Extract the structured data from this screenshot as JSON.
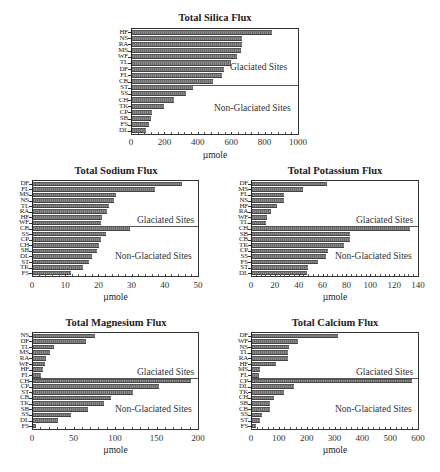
{
  "chart_data": [
    {
      "type": "bar",
      "orientation": "horizontal",
      "title": "Total Silica Flux",
      "xlabel": "µmole",
      "ylabel": "",
      "xlim": [
        0,
        1000
      ],
      "xticks": [
        0,
        200,
        400,
        600,
        800,
        1000
      ],
      "groups": [
        {
          "name": "Glaciated Sites",
          "categories": [
            "HF",
            "NS",
            "RA",
            "MS",
            "WF",
            "TL",
            "DF",
            "FL",
            "CB"
          ],
          "values": [
            845,
            660,
            660,
            655,
            630,
            595,
            555,
            540,
            490
          ]
        },
        {
          "name": "Non-Glaciated Sites",
          "categories": [
            "ST",
            "SS",
            "CH",
            "TK",
            "CP",
            "SB",
            "FS",
            "DL"
          ],
          "values": [
            365,
            325,
            255,
            190,
            120,
            115,
            100,
            85,
            60
          ]
        }
      ]
    },
    {
      "type": "bar",
      "orientation": "horizontal",
      "title": "Total Sodium Flux",
      "xlabel": "µmole",
      "ylabel": "",
      "xlim": [
        0,
        50
      ],
      "xticks": [
        0,
        10,
        20,
        30,
        40,
        50
      ],
      "groups": [
        {
          "name": "Glaciated Sites",
          "categories": [
            "DF",
            "FL",
            "MS",
            "NS",
            "TL",
            "RA",
            "HF",
            "WF"
          ],
          "values": [
            45,
            37,
            25,
            24.5,
            23,
            22.5,
            21,
            20.5
          ]
        },
        {
          "name": "Non-Glaciated Sites",
          "categories": [
            "CB",
            "SS",
            "CP",
            "CH",
            "SB",
            "DL",
            "ST",
            "TK",
            "FS"
          ],
          "values": [
            29.5,
            22,
            20.5,
            20,
            19.5,
            18,
            17,
            15,
            11.5
          ]
        }
      ]
    },
    {
      "type": "bar",
      "orientation": "horizontal",
      "title": "Total Potassium Flux",
      "xlabel": "µmole",
      "ylabel": "",
      "xlim": [
        0,
        140
      ],
      "xticks": [
        0,
        20,
        40,
        60,
        80,
        100,
        120,
        140
      ],
      "groups": [
        {
          "name": "Glaciated Sites",
          "categories": [
            "DF",
            "MS",
            "FL",
            "NS",
            "HF",
            "RA",
            "WF",
            "TL"
          ],
          "values": [
            63,
            43,
            27,
            27,
            21,
            16,
            13,
            12
          ]
        },
        {
          "name": "Non-Glaciated Sites",
          "categories": [
            "CH",
            "SB",
            "CB",
            "TK",
            "CP",
            "SS",
            "FS",
            "ST",
            "DL"
          ],
          "values": [
            133,
            83,
            83,
            78,
            64,
            62,
            56,
            47,
            46
          ]
        }
      ]
    },
    {
      "type": "bar",
      "orientation": "horizontal",
      "title": "Total Magnesium Flux",
      "xlabel": "µmole",
      "ylabel": "",
      "xlim": [
        0,
        200
      ],
      "xticks": [
        0,
        50,
        100,
        150,
        200
      ],
      "groups": [
        {
          "name": "Glaciated Sites",
          "categories": [
            "NS",
            "DF",
            "TL",
            "MS",
            "RA",
            "WF",
            "HF",
            "FL"
          ],
          "values": [
            75,
            64,
            25,
            20,
            16,
            15,
            12,
            10
          ]
        },
        {
          "name": "Non-Glaciated Sites",
          "categories": [
            "CH",
            "CP",
            "ST",
            "CB",
            "TK",
            "SB",
            "SS",
            "DL",
            "FS"
          ],
          "values": [
            191,
            153,
            121,
            95,
            86,
            67,
            46,
            30,
            4
          ]
        }
      ]
    },
    {
      "type": "bar",
      "orientation": "horizontal",
      "title": "Total Calcium Flux",
      "xlabel": "µmole",
      "ylabel": "",
      "xlim": [
        0,
        600
      ],
      "xticks": [
        0,
        100,
        200,
        300,
        400,
        500,
        600
      ],
      "groups": [
        {
          "name": "Glaciated Sites",
          "categories": [
            "DF",
            "WF",
            "NS",
            "TL",
            "RA",
            "HF",
            "MS",
            "FL"
          ],
          "values": [
            310,
            165,
            135,
            130,
            130,
            85,
            30,
            25
          ]
        },
        {
          "name": "Non-Glaciated Sites",
          "categories": [
            "CP",
            "DL",
            "TK",
            "CH",
            "SB",
            "CB",
            "SS",
            "ST",
            "FS"
          ],
          "values": [
            580,
            150,
            115,
            80,
            65,
            65,
            35,
            30,
            15
          ]
        }
      ]
    }
  ],
  "layout": [
    {
      "title_x": 215,
      "title_y": 12,
      "plot": [
        131,
        28,
        168,
        107
      ],
      "ticklabel_y": 137,
      "xlabel_y": 150,
      "region_glaciated": [
        230,
        62
      ],
      "region_nonglaciated": [
        214,
        103
      ]
    },
    {
      "title_x": 116,
      "title_y": 165,
      "plot": [
        32,
        180,
        167,
        97
      ],
      "ticklabel_y": 280,
      "xlabel_y": 292,
      "region_glaciated": [
        137,
        215
      ],
      "region_nonglaciated": [
        115,
        251
      ]
    },
    {
      "title_x": 335,
      "title_y": 165,
      "plot": [
        251,
        180,
        168,
        97
      ],
      "ticklabel_y": 280,
      "xlabel_y": 292,
      "region_glaciated": [
        356,
        215
      ],
      "region_nonglaciated": [
        335,
        251
      ]
    },
    {
      "title_x": 116,
      "title_y": 317,
      "plot": [
        32,
        332,
        167,
        98
      ],
      "ticklabel_y": 433,
      "xlabel_y": 445,
      "region_glaciated": [
        137,
        367
      ],
      "region_nonglaciated": [
        115,
        404
      ]
    },
    {
      "title_x": 335,
      "title_y": 317,
      "plot": [
        251,
        332,
        168,
        98
      ],
      "ticklabel_y": 433,
      "xlabel_y": 445,
      "region_glaciated": [
        356,
        367
      ],
      "region_nonglaciated": [
        335,
        404
      ]
    }
  ],
  "labels": {
    "glaciated": "Glaciated Sites",
    "non_glaciated": "Non-Glaciated Sites"
  }
}
